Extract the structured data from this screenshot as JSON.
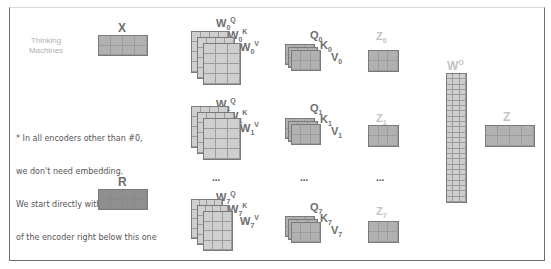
{
  "brand": {
    "line1": "Thinking",
    "line2": "Machines"
  },
  "note": {
    "lines": [
      "* In all encoders other than #0,",
      "we don't need embedding.",
      "We start directly with the output",
      "of the encoder right below this one"
    ]
  },
  "inputs": {
    "x_label": "X",
    "r_label": "R"
  },
  "heads": [
    {
      "w_q": "W",
      "w_q_sub": "0",
      "w_q_sup": "Q",
      "w_k": "W",
      "w_k_sub": "0",
      "w_k_sup": "K",
      "w_v": "W",
      "w_v_sub": "0",
      "w_v_sup": "V",
      "q": "Q",
      "q_sub": "0",
      "k": "K",
      "k_sub": "0",
      "v": "V",
      "v_sub": "0",
      "z": "Z",
      "z_sub": "0"
    },
    {
      "w_q": "W",
      "w_q_sub": "1",
      "w_q_sup": "Q",
      "w_k": "W",
      "w_k_sub": "1",
      "w_k_sup": "K",
      "w_v": "W",
      "w_v_sub": "1",
      "w_v_sup": "V",
      "q": "Q",
      "q_sub": "1",
      "k": "K",
      "k_sub": "1",
      "v": "V",
      "v_sub": "1",
      "z": "Z",
      "z_sub": "1"
    },
    {
      "w_q": "W",
      "w_q_sub": "7",
      "w_q_sup": "Q",
      "w_k": "W",
      "w_k_sub": "7",
      "w_k_sup": "K",
      "w_v": "W",
      "w_v_sub": "7",
      "w_v_sup": "V",
      "q": "Q",
      "q_sub": "7",
      "k": "K",
      "k_sub": "7",
      "v": "V",
      "v_sub": "7",
      "z": "Z",
      "z_sub": "7"
    }
  ],
  "ellipsis": "...",
  "output_weight": {
    "label": "W",
    "sup": "O"
  },
  "output": {
    "label": "Z"
  },
  "colors": {
    "matrix_dark": "#8f8f8f",
    "matrix_mid": "#b1b1b1",
    "matrix_light": "#cfcfcf",
    "label_dark": "#6e6e6e",
    "label_light": "#c3c3c3"
  }
}
